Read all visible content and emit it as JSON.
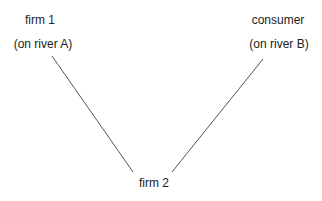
{
  "nodes": {
    "firm1": {
      "name": "firm 1",
      "location": "(on river A)"
    },
    "consumer": {
      "name": "consumer",
      "location": "(on river B)"
    },
    "firm2": {
      "name": "firm 2"
    }
  },
  "colors": {
    "line": "#555555",
    "text": "#222222"
  }
}
